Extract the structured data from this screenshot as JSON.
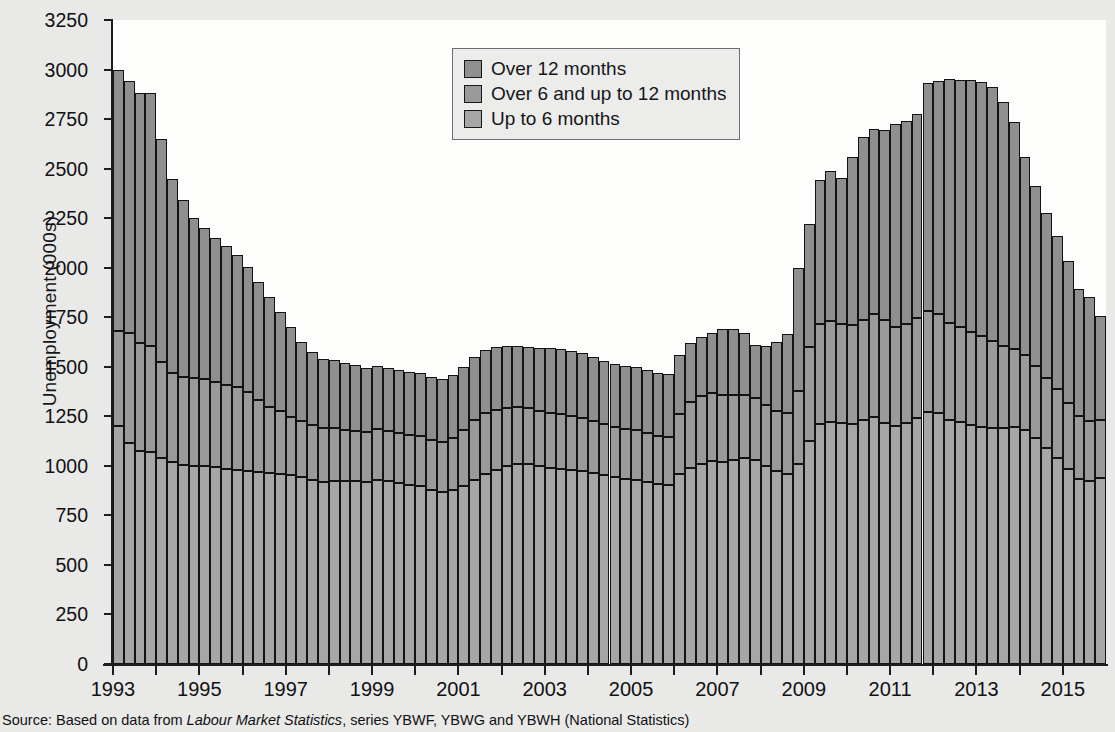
{
  "chart": {
    "ylabel": "Unemployment  (000s)",
    "yticks": [
      0,
      250,
      500,
      750,
      1000,
      1250,
      1500,
      1750,
      2000,
      2250,
      2500,
      2750,
      3000,
      3250
    ],
    "xticks": [
      "1993",
      "1995",
      "1997",
      "1999",
      "2001",
      "2003",
      "2005",
      "2007",
      "2009",
      "2011",
      "2013",
      "2015"
    ],
    "source_prefix": "Source: Based on data from ",
    "source_italic": "Labour Market Statistics",
    "source_suffix": ", series YBWF, YBWG and YBWH (National Statistics)"
  },
  "legend": {
    "items": [
      {
        "label": "Over 12 months",
        "color": "#8f8f8f"
      },
      {
        "label": "Over 6 and up to 12 months",
        "color": "#9a9a9a"
      },
      {
        "label": "Up to 6 months",
        "color": "#a6a6a6"
      }
    ]
  },
  "chart_data": {
    "type": "bar",
    "stacked": true,
    "title": "",
    "xlabel": "",
    "ylabel": "Unemployment (000s)",
    "ylim": [
      0,
      3250
    ],
    "ytick_step": 250,
    "grid": false,
    "legend_position": "top-center",
    "x_unit": "quarter",
    "x_start": "1993 Q1",
    "x_end": "2015 Q4",
    "categories": [
      "1993Q1",
      "1993Q2",
      "1993Q3",
      "1993Q4",
      "1994Q1",
      "1994Q2",
      "1994Q3",
      "1994Q4",
      "1995Q1",
      "1995Q2",
      "1995Q3",
      "1995Q4",
      "1996Q1",
      "1996Q2",
      "1996Q3",
      "1996Q4",
      "1997Q1",
      "1997Q2",
      "1997Q3",
      "1997Q4",
      "1998Q1",
      "1998Q2",
      "1998Q3",
      "1998Q4",
      "1999Q1",
      "1999Q2",
      "1999Q3",
      "1999Q4",
      "2000Q1",
      "2000Q2",
      "2000Q3",
      "2000Q4",
      "2001Q1",
      "2001Q2",
      "2001Q3",
      "2001Q4",
      "2002Q1",
      "2002Q2",
      "2002Q3",
      "2002Q4",
      "2003Q1",
      "2003Q2",
      "2003Q3",
      "2003Q4",
      "2004Q1",
      "2004Q2",
      "2004Q3",
      "2004Q4",
      "2005Q1",
      "2005Q2",
      "2005Q3",
      "2005Q4",
      "2006Q1",
      "2006Q2",
      "2006Q3",
      "2006Q4",
      "2007Q1",
      "2007Q2",
      "2007Q3",
      "2007Q4",
      "2008Q1",
      "2008Q2",
      "2008Q3",
      "2008Q4",
      "2009Q1",
      "2009Q2",
      "2009Q3",
      "2009Q4",
      "2010Q1",
      "2010Q2",
      "2010Q3",
      "2010Q4",
      "2011Q1",
      "2011Q2",
      "2011Q3",
      "2011Q4",
      "2012Q1",
      "2012Q2",
      "2012Q3",
      "2012Q4",
      "2013Q1",
      "2013Q2",
      "2013Q3",
      "2013Q4",
      "2014Q1",
      "2014Q2",
      "2014Q3",
      "2014Q4",
      "2015Q1",
      "2015Q2",
      "2015Q3",
      "2015Q4"
    ],
    "series": [
      {
        "name": "Up to 6 months",
        "color": "#a6a6a6",
        "values": [
          1200,
          1115,
          1075,
          1070,
          1040,
          1020,
          1005,
          1000,
          1000,
          995,
          985,
          980,
          975,
          970,
          965,
          960,
          955,
          945,
          930,
          920,
          925,
          925,
          925,
          920,
          930,
          925,
          915,
          905,
          900,
          880,
          870,
          880,
          900,
          930,
          960,
          980,
          1000,
          1010,
          1010,
          1000,
          990,
          985,
          980,
          975,
          965,
          955,
          945,
          935,
          930,
          920,
          910,
          905,
          960,
          990,
          1010,
          1025,
          1020,
          1030,
          1040,
          1030,
          1000,
          975,
          960,
          1010,
          1125,
          1210,
          1220,
          1215,
          1210,
          1230,
          1245,
          1215,
          1200,
          1215,
          1240,
          1270,
          1265,
          1230,
          1220,
          1205,
          1195,
          1190,
          1190,
          1195,
          1180,
          1140,
          1090,
          1040,
          985,
          935,
          925,
          940
        ]
      },
      {
        "name": "Over 6 and up to 12 months",
        "color": "#9a9a9a",
        "values": [
          480,
          555,
          545,
          535,
          485,
          450,
          445,
          445,
          440,
          430,
          425,
          420,
          400,
          360,
          330,
          315,
          290,
          280,
          275,
          270,
          265,
          255,
          250,
          250,
          255,
          250,
          250,
          250,
          250,
          250,
          250,
          260,
          280,
          300,
          305,
          300,
          290,
          285,
          280,
          275,
          275,
          275,
          270,
          265,
          260,
          255,
          250,
          250,
          250,
          245,
          240,
          240,
          300,
          330,
          340,
          345,
          340,
          330,
          320,
          310,
          305,
          300,
          305,
          370,
          475,
          505,
          510,
          500,
          500,
          505,
          520,
          520,
          500,
          500,
          505,
          510,
          500,
          490,
          480,
          470,
          460,
          440,
          415,
          395,
          380,
          365,
          355,
          350,
          330,
          315,
          300,
          290
        ]
      },
      {
        "name": "Over 12 months",
        "color": "#8f8f8f",
        "values": [
          1320,
          1270,
          1260,
          1275,
          1125,
          980,
          890,
          805,
          760,
          725,
          700,
          665,
          630,
          600,
          555,
          500,
          455,
          400,
          370,
          350,
          345,
          340,
          335,
          325,
          320,
          320,
          320,
          320,
          320,
          320,
          320,
          320,
          320,
          320,
          320,
          320,
          315,
          310,
          310,
          320,
          330,
          330,
          330,
          330,
          325,
          320,
          320,
          320,
          320,
          320,
          320,
          320,
          300,
          300,
          300,
          300,
          330,
          330,
          310,
          270,
          300,
          350,
          400,
          620,
          620,
          730,
          760,
          740,
          850,
          925,
          935,
          960,
          1025,
          1025,
          1030,
          1150,
          1175,
          1230,
          1245,
          1270,
          1280,
          1280,
          1230,
          1145,
          1000,
          905,
          830,
          770,
          720,
          640,
          625,
          525
        ]
      }
    ]
  }
}
